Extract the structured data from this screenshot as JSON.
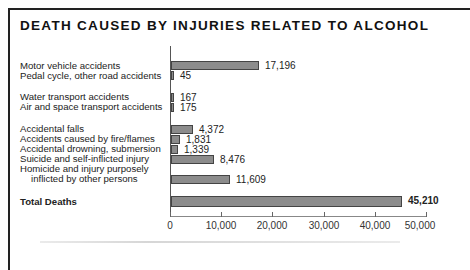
{
  "chart_data": {
    "type": "bar",
    "orientation": "horizontal",
    "title": "DEATH CAUSED BY INJURIES RELATED TO ALCOHOL",
    "categories": [
      "Motor vehicle accidents",
      "Pedal cycle, other road accidents",
      "Water transport accidents",
      "Air and space transport accidents",
      "Accidental falls",
      "Accidents caused by fire/flames",
      "Accidental drowning, submersion",
      "Suicide and self-inflicted injury",
      "Homicide and injury purposely inflicted by other persons",
      "Total Deaths"
    ],
    "values": [
      17196,
      45,
      167,
      175,
      4372,
      1831,
      1339,
      8476,
      11609,
      45210
    ],
    "value_labels": [
      "17,196",
      "45",
      "167",
      "175",
      "4,372",
      "1,831",
      "1,339",
      "8,476",
      "11,609",
      "45,210"
    ],
    "xlabel": "",
    "ylabel": "",
    "xlim": [
      0,
      50000
    ],
    "xticks": [
      "0",
      "10,000",
      "20,000",
      "30,000",
      "40,000",
      "50,000"
    ],
    "grid": false,
    "legend": null,
    "bar_color": "#8c8c8c"
  },
  "rows": [
    {
      "label": "Motor vehicle accidents",
      "value": 17196,
      "value_label": "17,196",
      "y": 61
    },
    {
      "label": "Pedal cycle, other road accidents",
      "value": 45,
      "value_label": "45",
      "y": 71
    },
    {
      "label": "Water transport accidents",
      "value": 167,
      "value_label": "167",
      "y": 93
    },
    {
      "label": "Air and space transport accidents",
      "value": 175,
      "value_label": "175",
      "y": 103
    },
    {
      "label": "Accidental falls",
      "value": 4372,
      "value_label": "4,372",
      "y": 125
    },
    {
      "label": "Accidents caused by fire/flames",
      "value": 1831,
      "value_label": "1,831",
      "y": 135
    },
    {
      "label": "Accidental drowning, submersion",
      "value": 1339,
      "value_label": "1,339",
      "y": 145
    },
    {
      "label": "Suicide and self-inflicted injury",
      "value": 8476,
      "value_label": "8,476",
      "y": 155
    },
    {
      "label": "Homicide and injury purposely",
      "label2": "inflicted by other persons",
      "value": 11609,
      "value_label": "11,609",
      "y": 175
    },
    {
      "label": "Total Deaths",
      "value": 45210,
      "value_label": "45,210",
      "y": 197
    }
  ]
}
